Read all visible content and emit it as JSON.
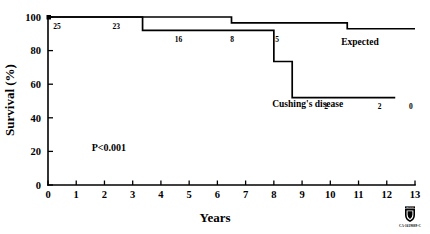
{
  "chart_data": {
    "type": "line",
    "subtype": "kaplan-meier-survival",
    "title": "",
    "xlabel": "Years",
    "ylabel": "Survival (%)",
    "xlim": [
      0,
      13
    ],
    "ylim": [
      0,
      100
    ],
    "xticks": [
      0,
      1,
      2,
      3,
      4,
      5,
      6,
      7,
      8,
      9,
      10,
      11,
      12,
      13
    ],
    "xtick_labels": [
      "0",
      "1",
      "2",
      "3",
      "4",
      "5",
      "6",
      "7",
      "8",
      "9",
      "10",
      "11",
      "12",
      "13"
    ],
    "yticks": [
      0,
      20,
      40,
      60,
      80,
      100
    ],
    "ytick_labels": [
      "0",
      "20",
      "40",
      "60",
      "80",
      "100"
    ],
    "grid": false,
    "legend_position": "inline-annotation",
    "annotations": [
      {
        "name": "p-value",
        "text": "P<0.001",
        "x": 1.55,
        "y": 20
      }
    ],
    "series": [
      {
        "name": "Expected",
        "label": "Expected",
        "label_x": 11.05,
        "label_y": 83.5,
        "step": "post",
        "points": [
          {
            "x": 0,
            "y": 100
          },
          {
            "x": 6.5,
            "y": 100
          },
          {
            "x": 6.5,
            "y": 96.5
          },
          {
            "x": 10.6,
            "y": 96.5
          },
          {
            "x": 10.6,
            "y": 93.0
          },
          {
            "x": 13,
            "y": 93.0
          }
        ]
      },
      {
        "name": "Cushing's disease",
        "label": "Cushing's disease",
        "label_x": 9.2,
        "label_y": 46.5,
        "step": "post",
        "points": [
          {
            "x": 0,
            "y": 100
          },
          {
            "x": 3.35,
            "y": 100
          },
          {
            "x": 3.35,
            "y": 92.0
          },
          {
            "x": 8.0,
            "y": 92.0
          },
          {
            "x": 8.0,
            "y": 73.5
          },
          {
            "x": 8.65,
            "y": 73.5
          },
          {
            "x": 8.65,
            "y": 52.0
          },
          {
            "x": 12.3,
            "y": 52.0
          }
        ]
      }
    ],
    "at_risk_labels": [
      {
        "value": "25",
        "x": 0.32,
        "y": 93.0
      },
      {
        "value": "23",
        "x": 2.42,
        "y": 93.0
      },
      {
        "value": "16",
        "x": 4.62,
        "y": 85.0
      },
      {
        "value": "8",
        "x": 6.52,
        "y": 85.0
      },
      {
        "value": "5",
        "x": 8.12,
        "y": 85.0
      },
      {
        "value": "2",
        "x": 9.85,
        "y": 45.0
      },
      {
        "value": "2",
        "x": 11.75,
        "y": 45.0
      },
      {
        "value": "0",
        "x": 12.85,
        "y": 45.0
      }
    ]
  },
  "footer": {
    "logo_name": "mayo-clinic-shield",
    "logo_top_text": "MAYO",
    "logo_code": "CA-1619889-C"
  },
  "colors": {
    "ink": "#000000",
    "background": "#ffffff"
  }
}
